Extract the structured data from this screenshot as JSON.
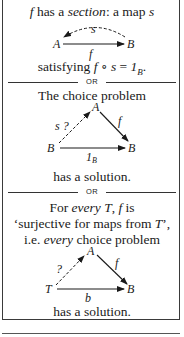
{
  "section_box": {
    "line1": {
      "pre": "",
      "f": "f",
      "mid": " has a ",
      "section": "section",
      "post": ": a map ",
      "s": "s"
    },
    "diagram1": {
      "nodes": {
        "left": "A",
        "right": "B"
      },
      "arrow_bottom_label": "f",
      "arrow_top_dashed_label": "s"
    },
    "line2": {
      "pre": "satisfying ",
      "f": "f",
      "comp": " ∘ ",
      "s": "s",
      "eq": " = ",
      "one": "1",
      "sub": "B",
      "end": "."
    },
    "divider1": "OR",
    "choice_title": "The choice problem",
    "diagram2": {
      "nodes": {
        "top": "A",
        "left": "B",
        "right": "B"
      },
      "dashed_label": "s ?",
      "right_label": "f",
      "bottom_label": "1",
      "bottom_label_sub": "B"
    },
    "solution1": "has a solution.",
    "divider2": "OR",
    "para": {
      "l1_pre": "For ",
      "l1_every": "every",
      "l1_T": " T",
      "l1_comma": ", ",
      "l1_f": "f",
      "l1_post": " is",
      "l2_pre": "‘surjective for maps from ",
      "l2_T": "T",
      "l2_post": "’,",
      "l3_pre": "i.e. ",
      "l3_every": "every",
      "l3_post": " choice problem"
    },
    "diagram3": {
      "nodes": {
        "top": "A",
        "left": "T",
        "right": "B"
      },
      "dashed_label": "?",
      "right_label": "f",
      "bottom_label": "b"
    },
    "solution2": "has a solution."
  }
}
